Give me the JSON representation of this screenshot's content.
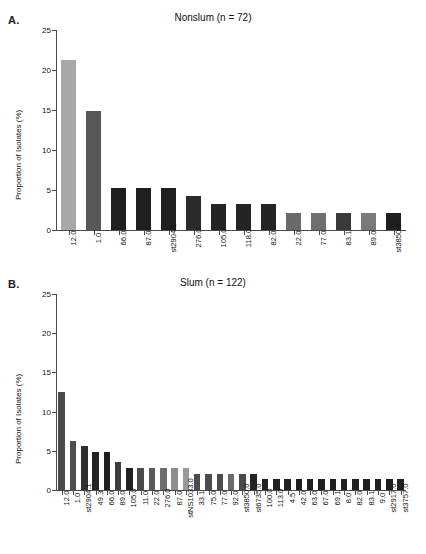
{
  "figure": {
    "panels": [
      {
        "letter": "A.",
        "title": "Nonslum (n = 72)",
        "ylabel": "Proportion of Isolates (%)"
      },
      {
        "letter": "B.",
        "title": "Slum (n = 122)",
        "ylabel": "Proportion of Isolates (%)"
      }
    ]
  },
  "chart_data": [
    {
      "type": "bar",
      "title": "Nonslum (n = 72)",
      "panel": "A.",
      "xlabel": "",
      "ylabel": "Proportion of Isolates (%)",
      "ylim": [
        0,
        25
      ],
      "yticks": [
        0,
        5,
        10,
        15,
        20,
        25
      ],
      "grid": false,
      "legend": "none",
      "categories": [
        "12.0",
        "1.0",
        "66.0",
        "87.0",
        "st2904.1",
        "276.0",
        "105.0",
        "118.0",
        "82.0",
        "22.0",
        "77.0",
        "83.1",
        "89.0",
        "st3850.0"
      ],
      "values": [
        21.3,
        14.9,
        5.3,
        5.3,
        5.3,
        4.2,
        3.2,
        3.2,
        3.2,
        2.1,
        2.1,
        2.1,
        2.1,
        2.1
      ],
      "colors": [
        "#a8a8a8",
        "#585858",
        "#1f1f1f",
        "#1f1f1f",
        "#1f1f1f",
        "#2a2a2a",
        "#242424",
        "#242424",
        "#242424",
        "#6a6a6a",
        "#6f6f6f",
        "#3a3a3a",
        "#7a7a7a",
        "#1f1f1f"
      ]
    },
    {
      "type": "bar",
      "title": "Slum (n = 122)",
      "panel": "B.",
      "xlabel": "",
      "ylabel": "Proportion of Isolates (%)",
      "ylim": [
        0,
        25
      ],
      "yticks": [
        0,
        5,
        10,
        15,
        20,
        25
      ],
      "grid": false,
      "legend": "none",
      "categories": [
        "12.0",
        "1.0",
        "st2904.1",
        "49.3",
        "66.0",
        "89.0",
        "105.0",
        "11.0",
        "22.0",
        "276.0",
        "87.0",
        "stNS1033.0",
        "33.1",
        "75.0",
        "77.0",
        "92.0",
        "st3850.0",
        "st6735.0",
        "100.0",
        "113.0",
        "4.5",
        "42.0",
        "63.0",
        "67.0",
        "69.1",
        "8.0",
        "82.0",
        "83.1",
        "9.0",
        "st2917.0",
        "st3757.0"
      ],
      "values": [
        12.5,
        6.2,
        5.6,
        4.9,
        4.9,
        3.6,
        2.8,
        2.8,
        2.8,
        2.8,
        2.8,
        2.8,
        2.1,
        2.1,
        2.1,
        2.1,
        2.1,
        2.1,
        1.4,
        1.4,
        1.4,
        1.4,
        1.4,
        1.4,
        1.4,
        1.4,
        1.4,
        1.4,
        1.4,
        1.4,
        1.4
      ],
      "colors": [
        "#4a4a4a",
        "#4f4f4f",
        "#2e2e2e",
        "#232323",
        "#1f1f1f",
        "#3d3d3d",
        "#222222",
        "#4a4a4a",
        "#5a5a5a",
        "#6e6e6e",
        "#8d8d8d",
        "#9a9a9a",
        "#4c4c4c",
        "#4c4c4c",
        "#4c4c4c",
        "#6a6a6a",
        "#4a4a4a",
        "#242424",
        "#1f1f1f",
        "#1f1f1f",
        "#1f1f1f",
        "#1f1f1f",
        "#1f1f1f",
        "#1f1f1f",
        "#1f1f1f",
        "#1f1f1f",
        "#1f1f1f",
        "#1f1f1f",
        "#1f1f1f",
        "#1f1f1f",
        "#1f1f1f"
      ]
    }
  ]
}
